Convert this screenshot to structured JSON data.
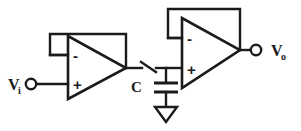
{
  "diagram": {
    "background_color": "#ffffff",
    "line_color": "#1b1b1b"
  },
  "ports": {
    "input": {
      "symbol": "V",
      "subscript": "i",
      "terminal": "open-circle"
    },
    "output": {
      "symbol": "V",
      "subscript": "o",
      "terminal": "open-circle"
    }
  },
  "components": {
    "opamp_left": {
      "name": "input-buffer-opamp",
      "inverting_sign": "-",
      "noninverting_sign": "+",
      "feedback": "unity-gain"
    },
    "opamp_right": {
      "name": "output-buffer-opamp",
      "inverting_sign": "-",
      "noninverting_sign": "+",
      "feedback": "unity-gain"
    },
    "switch": {
      "name": "sampling-switch",
      "state": "open"
    },
    "capacitor": {
      "name": "hold-capacitor",
      "label": "C"
    },
    "ground": {
      "name": "ground-symbol",
      "style": "triangle"
    }
  }
}
